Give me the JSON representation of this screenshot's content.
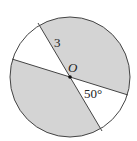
{
  "diagram": {
    "type": "circle-sectors",
    "center_label": "O",
    "radius_label": "3",
    "angle_label": "50°",
    "colors": {
      "shaded": "#d4d4d4",
      "unshaded": "#ffffff",
      "stroke": "#444444"
    },
    "geometry": {
      "cx": 70,
      "cy": 77,
      "r": 60,
      "line1": {
        "x1": 38,
        "y1": 23,
        "x2": 102,
        "y2": 131
      },
      "line2": {
        "x1": 12,
        "y1": 59,
        "x2": 128,
        "y2": 95
      }
    }
  }
}
